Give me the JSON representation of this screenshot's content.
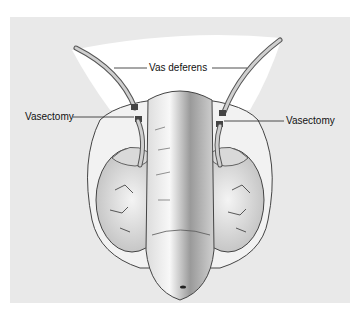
{
  "diagram": {
    "labels": {
      "vas_deferens": "Vas deferens",
      "vasectomy_left": "Vasectomy",
      "vasectomy_right": "Vasectomy"
    }
  },
  "colors": {
    "background": "#ffffff",
    "panel": "#e9e9e9",
    "skin_fill": "#f4f4f4",
    "outline": "#333333"
  }
}
